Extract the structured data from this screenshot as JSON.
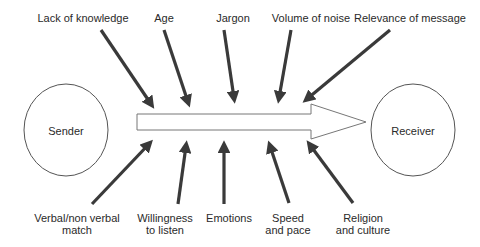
{
  "diagram": {
    "type": "communication-barriers",
    "nodes": {
      "sender": {
        "label": "Sender"
      },
      "receiver": {
        "label": "Receiver"
      }
    },
    "barriers_top": [
      {
        "label": "Lack of knowledge"
      },
      {
        "label": "Age"
      },
      {
        "label": "Jargon"
      },
      {
        "label": "Volume of noise"
      },
      {
        "label": "Relevance of message"
      }
    ],
    "barriers_bottom": [
      {
        "label_line1": "Verbal/non verbal",
        "label_line2": "match"
      },
      {
        "label_line1": "Willingness",
        "label_line2": "to listen"
      },
      {
        "label_line1": "Emotions",
        "label_line2": ""
      },
      {
        "label_line1": "Speed",
        "label_line2": "and pace"
      },
      {
        "label_line1": "Religion",
        "label_line2": "and culture"
      }
    ],
    "colors": {
      "arrow": "#3a3a3a",
      "outline": "#555555",
      "text": "#2a2a2a"
    }
  }
}
